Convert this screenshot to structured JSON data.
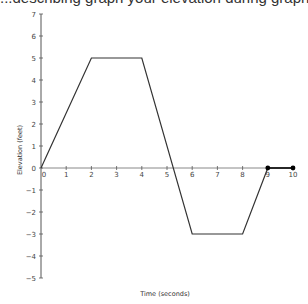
{
  "header": {
    "partial_text": "...describing graph your elevation during graph..."
  },
  "chart_data": {
    "type": "line",
    "title": "",
    "xlabel": "Time (seconds)",
    "ylabel": "Elevation (feet)",
    "xlim": [
      0,
      10
    ],
    "ylim": [
      -5,
      7
    ],
    "x_ticks": [
      0,
      1,
      2,
      3,
      4,
      5,
      6,
      7,
      8,
      9,
      10
    ],
    "y_ticks": [
      7,
      6,
      5,
      4,
      3,
      2,
      1,
      0,
      -1,
      -2,
      -3,
      -4,
      -5
    ],
    "grid": false,
    "series": [
      {
        "name": "elevation",
        "x": [
          0,
          2,
          4,
          6,
          8,
          9
        ],
        "y": [
          0,
          5,
          5,
          -3,
          -3,
          0
        ],
        "color": "#333333"
      },
      {
        "name": "segment-with-endpoints",
        "x": [
          9,
          10
        ],
        "y": [
          0,
          0
        ],
        "color": "#000000",
        "markers": true
      }
    ],
    "colors": {
      "axis": "#555555",
      "line": "#333333",
      "points": "#000000"
    }
  }
}
